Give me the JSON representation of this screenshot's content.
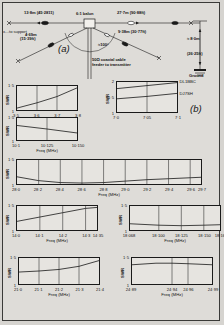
{
  "figure": {
    "panel_a_letter": "(a)",
    "panel_b_letter": "(b)"
  },
  "antenna": {
    "labels": {
      "left_wire": "13·8m (45·2811)",
      "right_wire": "27·7m (90·88ft)",
      "balun": "6:1 balun",
      "to_support": "x…to support",
      "lower_left_wire": "4·69m",
      "lower_left_wire2": "(15·39ft)",
      "lower_right_wire": "9·38m (30·77ft)",
      "angle": "≈100°",
      "feeder_line1": "50Ω coaxial cable",
      "feeder_line2": "feeder to transmitter",
      "height": "≈ 8·0m",
      "height2": "(26·25ft)",
      "ground": "Ground"
    }
  },
  "charts": [
    {
      "id": "chart-3p5",
      "type": "line",
      "ylabel": "SWR",
      "xlabel": "Freq (MHz)",
      "yticks": [
        "1",
        "1·5"
      ],
      "ylim": [
        1,
        1.5
      ],
      "xticks": [
        "3·5",
        "3·6",
        "3·7",
        "3·8"
      ],
      "xlim": [
        3.5,
        3.8
      ],
      "series": [
        {
          "name": "swr",
          "x": [
            3.5,
            3.6,
            3.7,
            3.8
          ],
          "values": [
            1.04,
            1.15,
            1.28,
            1.46
          ]
        }
      ]
    },
    {
      "id": "chart-7p0",
      "type": "line",
      "ylabel": "SWR",
      "xlabel": "",
      "yticks": [
        "1",
        "1·5",
        "2"
      ],
      "ylim": [
        1,
        2
      ],
      "xticks": [
        "7·0",
        "7·05",
        "7·1"
      ],
      "xlim": [
        7.0,
        7.1
      ],
      "annotations": [
        "DL1BBC",
        "DJ7SH"
      ],
      "series": [
        {
          "name": "DL1BBC",
          "x": [
            7.0,
            7.05,
            7.1
          ],
          "values": [
            1.78,
            1.88,
            1.98
          ]
        },
        {
          "name": "DJ7SH",
          "x": [
            7.0,
            7.05,
            7.1
          ],
          "values": [
            1.44,
            1.52,
            1.62
          ]
        }
      ]
    },
    {
      "id": "chart-10p1",
      "type": "line",
      "ylabel": "SWR",
      "xlabel": "Freq (MHz)",
      "yticks": [
        "1",
        "1·5"
      ],
      "ylim": [
        1,
        1.5
      ],
      "xticks": [
        "10·1",
        "10·125",
        "10·150"
      ],
      "xlim": [
        10.1,
        10.15
      ],
      "series": [
        {
          "name": "swr",
          "x": [
            10.1,
            10.125,
            10.15
          ],
          "values": [
            1.33,
            1.25,
            1.16
          ]
        }
      ]
    },
    {
      "id": "chart-28",
      "type": "line",
      "ylabel": "SWR",
      "xlabel": "Freq (MHz)",
      "yticks": [
        "1",
        "1·5"
      ],
      "ylim": [
        1,
        1.5
      ],
      "xticks": [
        "28·0",
        "28·2",
        "28·4",
        "28·6",
        "28·8",
        "29·0",
        "29·2",
        "29·4",
        "29·6",
        "29·7"
      ],
      "xlim": [
        28.0,
        29.7
      ],
      "series": [
        {
          "name": "swr",
          "x": [
            28.0,
            28.2,
            28.4,
            28.6,
            28.8,
            29.0,
            29.2,
            29.4,
            29.6,
            29.7
          ],
          "values": [
            1.15,
            1.07,
            1.03,
            1.02,
            1.03,
            1.06,
            1.09,
            1.11,
            1.13,
            1.14
          ]
        }
      ]
    },
    {
      "id": "chart-14",
      "type": "line",
      "ylabel": "SWR",
      "xlabel": "Freq (MHz)",
      "yticks": [
        "1",
        "1·5"
      ],
      "ylim": [
        1,
        1.5
      ],
      "xticks": [
        "14·0",
        "14·1",
        "14·2",
        "14·3",
        "14·35"
      ],
      "xlim": [
        14.0,
        14.35
      ],
      "series": [
        {
          "name": "swr",
          "x": [
            14.0,
            14.1,
            14.2,
            14.3,
            14.35
          ],
          "values": [
            1.18,
            1.27,
            1.36,
            1.45,
            1.47
          ]
        }
      ]
    },
    {
      "id": "chart-18",
      "type": "line",
      "ylabel": "SWR",
      "xlabel": "Freq (MHz)",
      "yticks": [
        "1",
        "1·5"
      ],
      "ylim": [
        1,
        1.5
      ],
      "xticks": [
        "18·068",
        "18·100",
        "18·125",
        "18·150",
        "18·168"
      ],
      "xlim": [
        18.068,
        18.168
      ],
      "series": [
        {
          "name": "swr",
          "x": [
            18.068,
            18.1,
            18.125,
            18.15,
            18.168
          ],
          "values": [
            1.13,
            1.1,
            1.09,
            1.1,
            1.11
          ]
        }
      ]
    },
    {
      "id": "chart-21",
      "type": "line",
      "ylabel": "SWR",
      "xlabel": "Freq (MHz)",
      "yticks": [
        "1",
        "1·5"
      ],
      "ylim": [
        1,
        1.5
      ],
      "xticks": [
        "21·0",
        "21·1",
        "21·2",
        "21·3",
        "21·4"
      ],
      "xlim": [
        21.0,
        21.4
      ],
      "series": [
        {
          "name": "swr",
          "x": [
            21.0,
            21.1,
            21.2,
            21.3,
            21.4
          ],
          "values": [
            1.23,
            1.25,
            1.28,
            1.34,
            1.45
          ]
        }
      ]
    },
    {
      "id": "chart-24",
      "type": "line",
      "ylabel": "SWR",
      "xlabel": "Freq (MHz)",
      "yticks": [
        "1",
        "1·5"
      ],
      "ylim": [
        1,
        1.5
      ],
      "xticks": [
        "24·89",
        "24·94",
        "24·96",
        "24·99"
      ],
      "xlim": [
        24.89,
        24.99
      ],
      "series": [
        {
          "name": "swr",
          "x": [
            24.89,
            24.92,
            24.94,
            24.96,
            24.99
          ],
          "values": [
            1.37,
            1.4,
            1.4,
            1.39,
            1.37
          ]
        }
      ]
    }
  ]
}
